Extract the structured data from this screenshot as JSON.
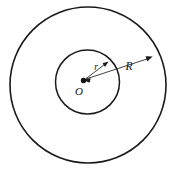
{
  "figure": {
    "background_color": "#ffffff",
    "stroke_color": "#1a1a1a",
    "canvas": {
      "width": 176,
      "height": 171
    },
    "center": {
      "x": 83.5,
      "y": 80.5
    },
    "labels": {
      "center_point": "O",
      "inner_radius": "r",
      "outer_radius": "R"
    },
    "shapes": {
      "outer_circle": {
        "cx": 88,
        "cy": 85,
        "r": 78,
        "stroke_width": 1.6
      },
      "inner_circle": {
        "cx": 87.5,
        "cy": 82,
        "r": 32,
        "stroke_width": 1.5
      },
      "center_dot": {
        "cx": 83.5,
        "cy": 80.5,
        "r": 2.6
      }
    },
    "arrows": {
      "inner_radius_arrow": {
        "label": "r",
        "from": {
          "x": 83.5,
          "y": 80.5
        },
        "to": {
          "x": 108,
          "y": 62
        },
        "label_pos": {
          "x": 96,
          "y": 68
        },
        "double_headed": true
      },
      "outer_radius_arrow": {
        "label": "R",
        "from": {
          "x": 83.5,
          "y": 80.5
        },
        "to": {
          "x": 152,
          "y": 57
        },
        "label_pos": {
          "x": 129,
          "y": 69
        },
        "double_headed": true
      }
    },
    "center_label_pos": {
      "x": 80,
      "y": 95
    }
  }
}
